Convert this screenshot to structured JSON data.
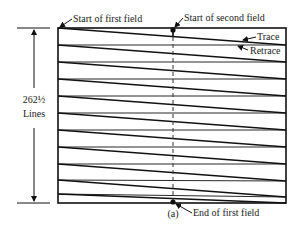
{
  "diagram": {
    "caption": "(a)",
    "labels": {
      "start_first_field": "Start of first field",
      "start_second_field": "Start of second field",
      "trace": "Trace",
      "retrace": "Retrace",
      "end_first_field": "End of first field",
      "line_count_value": "262½",
      "line_count_unit": "Lines"
    },
    "raster": {
      "left": 58,
      "right": 286,
      "top": 28,
      "bottom": 203,
      "midline_x": 173,
      "scan_start_y": [
        28,
        45,
        62,
        79,
        96,
        113,
        130,
        147,
        164,
        180,
        194
      ],
      "trace_drop": 17
    },
    "colors": {
      "stroke": "#111111",
      "text": "#222222",
      "background": "#ffffff"
    }
  }
}
